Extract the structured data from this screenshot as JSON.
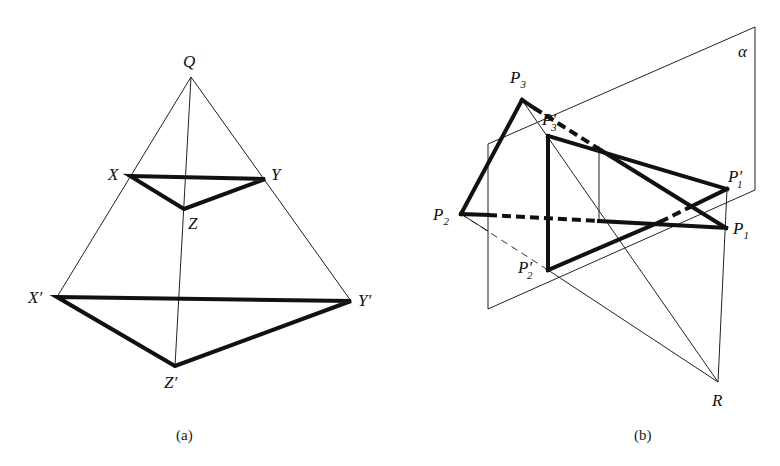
{
  "figure_a": {
    "caption": "(a)",
    "labels": {
      "Q": "Q",
      "X": "X",
      "Y": "Y",
      "Z": "Z",
      "Xp": "X′",
      "Yp": "Y′",
      "Zp": "Z′"
    }
  },
  "figure_b": {
    "caption": "(b)",
    "labels": {
      "P": "P",
      "P1_sub": "1",
      "P2_sub": "2",
      "P3_sub": "3",
      "prime": "′",
      "R": "R",
      "alpha": "α"
    }
  }
}
